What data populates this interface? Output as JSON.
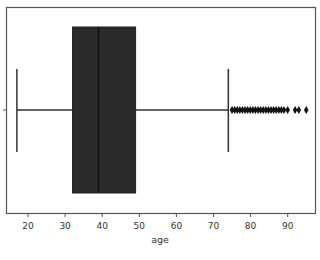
{
  "chart_data": {
    "type": "box",
    "orientation": "horizontal",
    "title": "",
    "xlabel": "age",
    "ylabel": "",
    "xlim": [
      14.2,
      97.5
    ],
    "xticks": [
      20,
      30,
      40,
      50,
      60,
      70,
      80,
      90
    ],
    "xtick_labels": [
      "20",
      "30",
      "40",
      "50",
      "60",
      "70",
      "80",
      "90"
    ],
    "grid": false,
    "legend": null,
    "box": {
      "whisker_low": 17,
      "q1": 32,
      "median": 39,
      "q3": 49,
      "whisker_high": 74
    },
    "outliers": [
      75,
      75.7,
      76.4,
      77.1,
      77.8,
      78.5,
      79.2,
      79.9,
      80.6,
      81.3,
      82,
      82.7,
      83.4,
      84.1,
      84.8,
      85.5,
      86.2,
      86.9,
      87.6,
      88.3,
      89,
      90,
      92,
      93,
      95
    ],
    "colors": {
      "box_fill": "#2b2b2b",
      "lines": "#333333",
      "frame": "#555555"
    }
  }
}
